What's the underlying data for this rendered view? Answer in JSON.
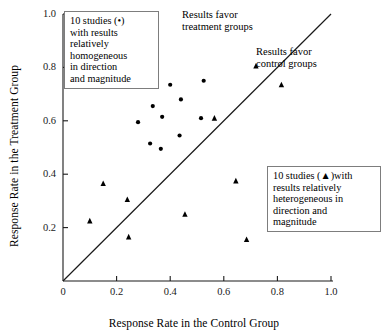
{
  "chart_data": {
    "type": "scatter",
    "title": "",
    "xlabel": "Response Rate in the Control Group",
    "ylabel": "Response Rate in the Treatment Group",
    "xlim": [
      0,
      1.0
    ],
    "ylim": [
      0,
      1.0
    ],
    "grid": false,
    "xticks": [
      "0",
      "0.2",
      "0.4",
      "0.6",
      "0.8",
      "1.0"
    ],
    "xtick_values": [
      0,
      0.2,
      0.4,
      0.6,
      0.8,
      1.0
    ],
    "yticks": [
      "0.2",
      "0.4",
      "0.6",
      "0.8",
      "1.0"
    ],
    "ytick_values": [
      0.2,
      0.4,
      0.6,
      0.8,
      1.0
    ],
    "reference_line": {
      "name": "line-of-equality",
      "from": [
        0,
        0
      ],
      "to": [
        1.0,
        1.0
      ]
    },
    "series": [
      {
        "name": "10 studies with results relatively homogeneous in direction and magnitude",
        "marker": "circle",
        "color": "#000000",
        "points": [
          [
            0.28,
            0.595
          ],
          [
            0.325,
            0.515
          ],
          [
            0.335,
            0.655
          ],
          [
            0.365,
            0.495
          ],
          [
            0.37,
            0.615
          ],
          [
            0.4,
            0.735
          ],
          [
            0.435,
            0.545
          ],
          [
            0.44,
            0.68
          ],
          [
            0.515,
            0.61
          ],
          [
            0.525,
            0.75
          ]
        ]
      },
      {
        "name": "10 studies with results relatively heterogeneous in direction and magnitude",
        "marker": "triangle",
        "color": "#000000",
        "points": [
          [
            0.1,
            0.225
          ],
          [
            0.15,
            0.365
          ],
          [
            0.24,
            0.305
          ],
          [
            0.245,
            0.165
          ],
          [
            0.455,
            0.25
          ],
          [
            0.565,
            0.61
          ],
          [
            0.645,
            0.375
          ],
          [
            0.685,
            0.155
          ],
          [
            0.72,
            0.805
          ],
          [
            0.815,
            0.735
          ]
        ]
      }
    ],
    "annotations": [
      {
        "name": "results-favor-treatment",
        "text": "Results favor\ntreatment groups",
        "position": "above-left-of-diagonal"
      },
      {
        "name": "results-favor-control",
        "text": "Results favor\ncontrol groups",
        "position": "below-right-of-diagonal"
      }
    ],
    "legend_boxes": [
      {
        "name": "legend-homogeneous",
        "text": "10 studies (•)\nwith results\nrelatively\nhomogeneous\nin direction\nand magnitude",
        "marker": "circle"
      },
      {
        "name": "legend-heterogeneous",
        "text": "10 studies (▲)with\nresults relatively\nheterogeneous in\ndirection and\nmagnitude",
        "marker": "triangle"
      }
    ]
  },
  "axes": {
    "x_title": "Response Rate in the Control Group",
    "y_title": "Response Rate in the Treatment Group"
  },
  "annotations": {
    "treatment": "Results favor\ntreatment groups",
    "control": "Results favor\ncontrol groups"
  },
  "legend": {
    "homogeneous": "10 studies (•)\nwith results\nrelatively\nhomogeneous\nin direction\nand magnitude",
    "heterogeneous": "10 studies (▲)with\nresults relatively\nheterogeneous in\ndirection and\nmagnitude"
  },
  "colors": {
    "marker": "#000000",
    "axis": "#1a1a1a",
    "box_border": "#7d7d7d"
  }
}
